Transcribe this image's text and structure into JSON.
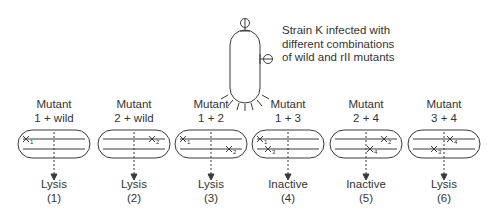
{
  "figure": {
    "host": {
      "caption_lines": [
        "Strain K infected with",
        "different combinations",
        "of wild and rII mutants"
      ]
    },
    "crosses": [
      {
        "label_line1": "Mutant",
        "label_line2": "1 + wild",
        "marks": [
          {
            "label": "1",
            "strand": "top",
            "pos": "left"
          }
        ],
        "result": "Lysis",
        "number": "(1)"
      },
      {
        "label_line1": "Mutant",
        "label_line2": "2 + wild",
        "marks": [
          {
            "label": "2",
            "strand": "top",
            "pos": "right"
          }
        ],
        "result": "Lysis",
        "number": "(2)"
      },
      {
        "label_line1": "Mutant",
        "label_line2": "1 + 2",
        "marks": [
          {
            "label": "1",
            "strand": "top",
            "pos": "left"
          },
          {
            "label": "2",
            "strand": "bottom",
            "pos": "right"
          }
        ],
        "result": "Lysis",
        "number": "(3)"
      },
      {
        "label_line1": "Mutant",
        "label_line2": "1 + 3",
        "marks": [
          {
            "label": "1",
            "strand": "top",
            "pos": "left"
          },
          {
            "label": "3",
            "strand": "bottom",
            "pos": "left"
          }
        ],
        "result": "Inactive",
        "number": "(4)"
      },
      {
        "label_line1": "Mutant",
        "label_line2": "2 + 4",
        "marks": [
          {
            "label": "2",
            "strand": "top",
            "pos": "right"
          },
          {
            "label": "4",
            "strand": "bottom",
            "pos": "right"
          }
        ],
        "result": "Inactive",
        "number": "(5)"
      },
      {
        "label_line1": "Mutant",
        "label_line2": "3 + 4",
        "marks": [
          {
            "label": "4",
            "strand": "top",
            "pos": "right"
          },
          {
            "label": "3",
            "strand": "bottom",
            "pos": "left"
          }
        ],
        "result": "Lysis",
        "number": "(6)"
      }
    ],
    "colors": {
      "line": "#3a3a3a",
      "text": "#333333"
    }
  }
}
